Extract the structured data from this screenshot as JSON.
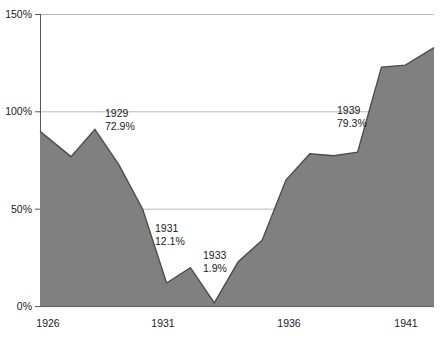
{
  "chart_data": {
    "type": "area",
    "title": "",
    "subtitle": "",
    "xlabel": "",
    "ylabel": "",
    "xlim": [
      1925.7,
      1942.2
    ],
    "ylim": [
      0,
      150
    ],
    "grid": true,
    "legend": "none",
    "series_color": "#808080",
    "line_color": "#4d4d4d",
    "x": [
      1925.7,
      1927,
      1928,
      1929,
      1930,
      1931,
      1932,
      1933,
      1934,
      1935,
      1936,
      1937,
      1938,
      1939,
      1940,
      1941,
      1942.2
    ],
    "values": [
      90.0,
      77.0,
      91.0,
      72.9,
      50.0,
      12.1,
      20.0,
      1.9,
      23.0,
      34.0,
      65.0,
      78.5,
      77.5,
      79.3,
      123.0,
      124.0,
      133.0
    ],
    "y_ticks": [
      0,
      50,
      100,
      150
    ],
    "y_tick_labels": [
      "0%",
      "50%",
      "100%",
      "150%"
    ],
    "x_ticks": [
      1926,
      1931,
      1936,
      1941
    ],
    "x_tick_labels": [
      "1926",
      "1931",
      "1936",
      "1941"
    ],
    "annotations": [
      {
        "year_label": "1929",
        "value_label": "72.9%",
        "x": 1929,
        "y": 72.9
      },
      {
        "year_label": "1931",
        "value_label": "12.1%",
        "x": 1931,
        "y": 12.1
      },
      {
        "year_label": "1933",
        "value_label": "1.9%",
        "x": 1933,
        "y": 1.9
      },
      {
        "year_label": "1939",
        "value_label": "79.3%",
        "x": 1939,
        "y": 79.3
      }
    ]
  },
  "axis": {
    "y_labels": [
      "150%",
      "100%",
      "50%",
      "0%"
    ],
    "x_labels": [
      "1926",
      "1931",
      "1936",
      "1941"
    ]
  },
  "annotations": [
    {
      "year": "1929",
      "value": "72.9%"
    },
    {
      "year": "1931",
      "value": "12.1%"
    },
    {
      "year": "1933",
      "value": "1.9%"
    },
    {
      "year": "1939",
      "value": "79.3%"
    }
  ],
  "colors": {
    "area_fill": "#808080",
    "area_stroke": "#4d4d4d",
    "gridline": "#b3b3b3",
    "axis": "#4d4d4d",
    "text": "#1a1a1a",
    "background": "#ffffff"
  }
}
